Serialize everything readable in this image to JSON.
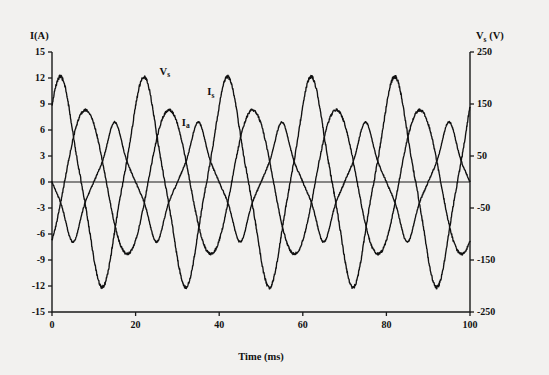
{
  "chart_data": {
    "type": "line",
    "title": "",
    "xlabel": "Time (ms)",
    "ylabel": "I(A)",
    "ylabel_right": "Vs (V)",
    "xlim": [
      0,
      100
    ],
    "ylim": [
      -15,
      15
    ],
    "ylim_right": [
      -250,
      250
    ],
    "grid": false,
    "legend_position": "inline-annotations",
    "xticks": [
      0,
      20,
      40,
      60,
      80,
      100
    ],
    "xtick_labels": [
      "0",
      "20",
      "40",
      "60",
      "80",
      "100"
    ],
    "yticks": [
      15,
      12,
      9,
      6,
      3,
      0,
      -3,
      -6,
      -9,
      -12,
      -15
    ],
    "ytick_labels": [
      "15",
      "12",
      "9",
      "6",
      "3",
      "0",
      "-3",
      "-6",
      "-9",
      "-12",
      "-15"
    ],
    "yticks_right": [
      250,
      150,
      50,
      -50,
      -150,
      -250
    ],
    "ytick_labels_right": [
      "250",
      "150",
      "50",
      "-50",
      "-150",
      "-250"
    ],
    "frequency_hz": 50,
    "period_ms": 20,
    "series": [
      {
        "name": "Vs",
        "label_base": "V",
        "label_sub": "s",
        "axis": "right",
        "units": "V",
        "amplitude": 11.2,
        "amplitude_volts": 187,
        "phase_deg": 54,
        "waveshape": "sine-flattened-peak",
        "label_x": 27,
        "label_y": 12.4,
        "peaks_ms": [
          7,
          27,
          47,
          67,
          87
        ],
        "troughs_ms": [
          17,
          37,
          57,
          77,
          97
        ],
        "value_at_0": 6.9
      },
      {
        "name": "Is",
        "label_base": "I",
        "label_sub": "s",
        "axis": "left",
        "units": "A",
        "amplitude": 8.3,
        "phase_deg": -54,
        "waveshape": "sine",
        "label_x": 38,
        "label_y": 10.0,
        "peaks_ms": [
          17,
          37,
          57,
          77,
          97
        ],
        "troughs_ms": [
          7,
          27,
          47,
          67,
          87
        ],
        "value_at_0": -5.0
      },
      {
        "name": "Ia",
        "label_base": "I",
        "label_sub": "a",
        "axis": "left",
        "units": "A",
        "amplitude": 5.3,
        "phase_deg": 180,
        "waveshape": "flat-topped-ripple",
        "label_x": 32,
        "label_y": 6.5,
        "peaks_ms": [
          12,
          32,
          52,
          72,
          92
        ],
        "troughs_ms": [
          2,
          22,
          42,
          62,
          82
        ],
        "value_at_0": -4.6
      }
    ]
  }
}
